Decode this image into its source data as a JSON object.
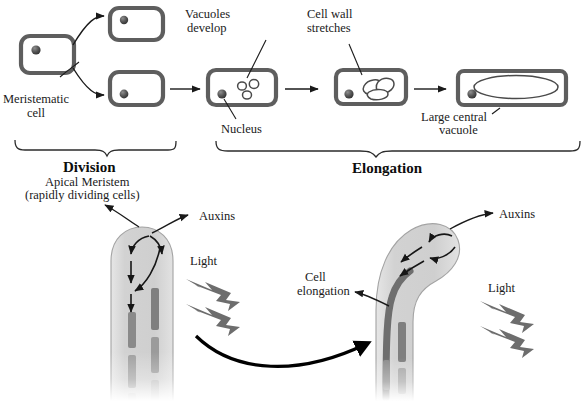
{
  "figure": {
    "background_color": "#ffffff",
    "width": 586,
    "height": 401
  },
  "colors": {
    "cell_wall": "#5e5e5e",
    "nucleus": "#4d4d4d",
    "vacuole_outline": "#4a4a4a",
    "shoot_fill": "#d4d4d4",
    "shoot_outline": "#9a9a9a",
    "cell_bar": "#7c7c7c",
    "dark_band": "#6b6b6b",
    "light_bolt": "#6d6d6d",
    "text": "#1a1a1a",
    "arrow": "#1a1a1a"
  },
  "top_panel": {
    "stages": [
      {
        "label": "Division",
        "name": "stage-division"
      },
      {
        "label": "Elongation",
        "name": "stage-elongation"
      }
    ],
    "labels": {
      "meristematic_cell": "Meristematic\ncell",
      "meristematic_cell_line1": "Meristematic",
      "meristematic_cell_line2": "cell",
      "vacuoles_develop_line1": "Vacuoles",
      "vacuoles_develop_line2": "develop",
      "nucleus": "Nucleus",
      "cell_wall_stretches_line1": "Cell wall",
      "cell_wall_stretches_line2": "stretches",
      "large_central_vacuole_line1": "Large central",
      "large_central_vacuole_line2": "vacuole"
    },
    "cells": [
      {
        "name": "meristematic-cell",
        "vacuole_count": 0,
        "shape": "rounded-square"
      },
      {
        "name": "daughter-cell-upper",
        "vacuole_count": 0,
        "shape": "rounded-square"
      },
      {
        "name": "daughter-cell-lower",
        "vacuole_count": 0,
        "shape": "rounded-square"
      },
      {
        "name": "vacuolating-cell",
        "vacuole_count": 3,
        "shape": "rounded-rect"
      },
      {
        "name": "stretching-cell",
        "vacuole_count": 3,
        "shape": "elongated-rect"
      },
      {
        "name": "mature-vacuolated-cell",
        "vacuole_count": 1,
        "shape": "long-rect"
      }
    ]
  },
  "bottom_panel": {
    "left_shoot": {
      "name": "straight-shoot",
      "state": "upright",
      "labels": {
        "apical_meristem_line1": "Apical Meristem",
        "apical_meristem_line2": "(rapidly dividing cells)",
        "auxins": "Auxins",
        "light": "Light"
      },
      "light_bolts": 2,
      "cell_columns": 2
    },
    "right_shoot": {
      "name": "bent-shoot",
      "state": "bending-toward-light",
      "labels": {
        "auxins": "Auxins",
        "light": "Light",
        "cell_elongation_line1": "Cell",
        "cell_elongation_line2": "elongation"
      },
      "light_bolts": 2,
      "cell_columns": 2
    },
    "transition_arrow": {
      "name": "transition-arrow",
      "description": "curved arrow from upright shoot to bent shoot"
    }
  }
}
